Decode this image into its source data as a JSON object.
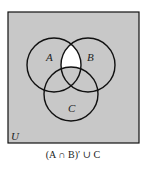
{
  "diagram": {
    "type": "venn",
    "universe_label": "U",
    "sets": [
      {
        "label": "A"
      },
      {
        "label": "B"
      },
      {
        "label": "C"
      }
    ],
    "shaded_region": "everything except (A ∩ B) − C",
    "unshaded_region": "A ∩ B ∩ C′",
    "caption": "(A ∩ B)′ ∪ C",
    "colors": {
      "shade": "#c8c8c8",
      "unshaded": "#ffffff",
      "stroke": "#111111"
    }
  }
}
